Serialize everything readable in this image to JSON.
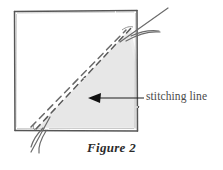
{
  "figure": {
    "caption": "Figure 2",
    "annotation_label": "stitching line",
    "colors": {
      "background": "#ffffff",
      "ink": "#4a4a4a",
      "ink_dark": "#2b2b2b",
      "shading": "#ebebeb",
      "arrow": "#1a1a1a"
    },
    "elements": {
      "fabric_square_name": "fabric square outline",
      "shaded_triangle_name": "shaded corner triangle",
      "stitch_dashed_line_name": "dashed stitching line",
      "fold_dashed_line_name": "dashed fold line",
      "arrow_name": "annotation arrow",
      "thread_top_right_name": "thread at top right corner",
      "thread_bottom_left_name": "thread at bottom left corner"
    },
    "geometry": {
      "square": {
        "left": 14,
        "top": 11,
        "right": 137,
        "bottom": 131
      },
      "triangle_points": "37,128 131,28 137,128",
      "stitch_line": {
        "x1": 36,
        "y1": 129,
        "x2": 133,
        "y2": 26
      },
      "fold_line": {
        "x1": 32,
        "y1": 127,
        "x2": 125,
        "y2": 31
      },
      "arrow_tip": {
        "x": 89,
        "y": 98
      },
      "arrow_tail": {
        "x": 143,
        "y": 98
      }
    }
  }
}
